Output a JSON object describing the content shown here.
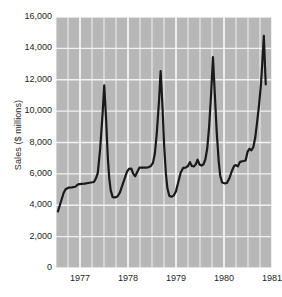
{
  "chart_data": {
    "type": "line",
    "title": "",
    "subtitle": "",
    "xlabel": "",
    "ylabel": "Sales ($ millions)",
    "ylim": [
      0,
      16000
    ],
    "xlim": [
      1976.5,
      1981.0
    ],
    "grid": true,
    "legend": null,
    "y_ticks": [
      0,
      2000,
      4000,
      6000,
      8000,
      10000,
      12000,
      14000,
      16000
    ],
    "y_tick_labels": [
      "0",
      "2,000",
      "4,000",
      "6,000",
      "8,000",
      "10,000",
      "12,000",
      "14,000",
      "16,000"
    ],
    "x_ticks": [
      1977,
      1978,
      1979,
      1980,
      1981
    ],
    "x_tick_labels": [
      "1977",
      "1978",
      "1979",
      "1980",
      "1981"
    ],
    "x_minor_interval": 0.25,
    "series": [
      {
        "name": "Sales",
        "color": "#1a1a1a",
        "x": [
          1976.54,
          1976.62,
          1976.71,
          1976.79,
          1976.87,
          1976.96,
          1977.04,
          1977.12,
          1977.21,
          1977.29,
          1977.37,
          1977.46,
          1977.54,
          1977.62,
          1977.71,
          1977.79,
          1977.87,
          1977.96,
          1978.04,
          1978.12,
          1978.21,
          1978.29,
          1978.37,
          1978.46,
          1978.54,
          1978.62,
          1978.71,
          1978.79,
          1978.87,
          1978.96,
          1979.04,
          1979.12,
          1979.21,
          1979.29,
          1979.37,
          1979.46,
          1979.54,
          1979.62,
          1979.71,
          1979.79,
          1979.87,
          1979.96,
          1980.04,
          1980.12,
          1980.21,
          1980.29,
          1980.37,
          1980.46,
          1980.54,
          1980.62,
          1980.71,
          1980.79,
          1980.87,
          1980.96
        ],
        "y": [
          3600,
          4150,
          4750,
          5050,
          5150,
          5150,
          5350,
          5400,
          5400,
          5450,
          5500,
          6000,
          11650,
          6700,
          5150,
          4500,
          4550,
          4800,
          5250,
          5700,
          6300,
          6350,
          5850,
          6100,
          6400,
          6400,
          6400,
          6500,
          7200,
          9400,
          12550,
          7600,
          5050,
          4550,
          4600,
          5300,
          6400,
          6500,
          6700,
          6450,
          6800,
          6550,
          6650,
          6600,
          8200,
          13450,
          8400,
          5500,
          5400,
          5400,
          6300,
          6550,
          6700,
          6800
        ],
        "note": "Monthly sales with sharp December/holiday peaks; final segment rises to 14,800 then drops to 11,700"
      }
    ],
    "path_points": [
      [
        1976.54,
        3600
      ],
      [
        1976.58,
        4000
      ],
      [
        1976.62,
        4400
      ],
      [
        1976.66,
        4800
      ],
      [
        1976.7,
        5020
      ],
      [
        1976.76,
        5120
      ],
      [
        1976.83,
        5140
      ],
      [
        1976.9,
        5180
      ],
      [
        1976.96,
        5330
      ],
      [
        1977.03,
        5360
      ],
      [
        1977.1,
        5380
      ],
      [
        1977.17,
        5420
      ],
      [
        1977.23,
        5450
      ],
      [
        1977.29,
        5480
      ],
      [
        1977.33,
        5700
      ],
      [
        1977.37,
        6050
      ],
      [
        1977.42,
        7600
      ],
      [
        1977.47,
        9800
      ],
      [
        1977.505,
        11650
      ],
      [
        1977.545,
        9400
      ],
      [
        1977.58,
        7000
      ],
      [
        1977.61,
        5700
      ],
      [
        1977.64,
        4950
      ],
      [
        1977.68,
        4520
      ],
      [
        1977.73,
        4500
      ],
      [
        1977.78,
        4560
      ],
      [
        1977.83,
        4800
      ],
      [
        1977.88,
        5250
      ],
      [
        1977.93,
        5700
      ],
      [
        1977.98,
        6150
      ],
      [
        1978.02,
        6320
      ],
      [
        1978.07,
        6330
      ],
      [
        1978.11,
        6000
      ],
      [
        1978.15,
        5850
      ],
      [
        1978.19,
        6100
      ],
      [
        1978.24,
        6400
      ],
      [
        1978.3,
        6400
      ],
      [
        1978.36,
        6400
      ],
      [
        1978.42,
        6420
      ],
      [
        1978.47,
        6480
      ],
      [
        1978.52,
        6700
      ],
      [
        1978.56,
        7300
      ],
      [
        1978.6,
        8600
      ],
      [
        1978.645,
        10600
      ],
      [
        1978.68,
        12550
      ],
      [
        1978.72,
        10200
      ],
      [
        1978.755,
        7700
      ],
      [
        1978.79,
        6000
      ],
      [
        1978.82,
        5100
      ],
      [
        1978.86,
        4600
      ],
      [
        1978.9,
        4540
      ],
      [
        1978.95,
        4600
      ],
      [
        1979.0,
        4900
      ],
      [
        1979.05,
        5500
      ],
      [
        1979.1,
        6100
      ],
      [
        1979.15,
        6380
      ],
      [
        1979.2,
        6400
      ],
      [
        1979.25,
        6500
      ],
      [
        1979.29,
        6750
      ],
      [
        1979.33,
        6500
      ],
      [
        1979.37,
        6480
      ],
      [
        1979.41,
        6600
      ],
      [
        1979.45,
        6900
      ],
      [
        1979.49,
        6600
      ],
      [
        1979.53,
        6530
      ],
      [
        1979.57,
        6600
      ],
      [
        1979.61,
        6900
      ],
      [
        1979.65,
        7600
      ],
      [
        1979.69,
        9000
      ],
      [
        1979.73,
        11000
      ],
      [
        1979.77,
        13450
      ],
      [
        1979.81,
        11000
      ],
      [
        1979.85,
        8600
      ],
      [
        1979.89,
        6800
      ],
      [
        1979.92,
        5900
      ],
      [
        1979.96,
        5450
      ],
      [
        1980.01,
        5400
      ],
      [
        1980.06,
        5420
      ],
      [
        1980.11,
        5700
      ],
      [
        1980.16,
        6150
      ],
      [
        1980.21,
        6500
      ],
      [
        1980.25,
        6560
      ],
      [
        1980.29,
        6480
      ],
      [
        1980.33,
        6750
      ],
      [
        1980.37,
        6800
      ],
      [
        1980.41,
        6820
      ],
      [
        1980.45,
        6850
      ],
      [
        1980.49,
        7400
      ],
      [
        1980.53,
        7600
      ],
      [
        1980.57,
        7500
      ],
      [
        1980.61,
        7700
      ],
      [
        1980.65,
        8300
      ],
      [
        1980.69,
        9300
      ],
      [
        1980.73,
        10400
      ],
      [
        1980.77,
        11700
      ],
      [
        1980.8,
        13200
      ],
      [
        1980.83,
        14800
      ],
      [
        1980.845,
        13600
      ],
      [
        1980.86,
        12400
      ],
      [
        1980.87,
        11700
      ]
    ]
  },
  "style": {
    "plot_background": "#b7b7b7",
    "gridline_color": "#f2f2f2",
    "line_color": "#1a1a1a",
    "text_color": "#1e1e1e",
    "page_background": "#ffffff"
  }
}
